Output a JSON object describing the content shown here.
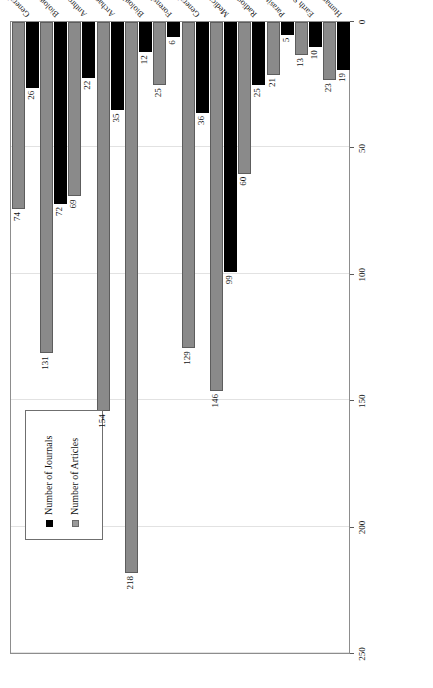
{
  "chart_data": {
    "type": "bar",
    "orientation": "horizontal",
    "title": "",
    "subtitle": "",
    "xlabel": "",
    "ylabel": "",
    "xlim": [
      0,
      250
    ],
    "xticks": [
      "0",
      "50",
      "100",
      "150",
      "200",
      "250"
    ],
    "grid": true,
    "legend_position": "upper-left",
    "categories": [
      "General Science",
      "Biology/Chemistry",
      "Anthropology",
      "Archaeology",
      "Biological Anthropology",
      "Forensic",
      "General Medical",
      "Medical Specialties",
      "Radiography/Imaging",
      "Parasitology",
      "Earth Science",
      "Humanities"
    ],
    "series": [
      {
        "name": "Number of Journals",
        "color": "#000000",
        "values": [
          26,
          72,
          22,
          35,
          12,
          6,
          36,
          99,
          25,
          5,
          10,
          19
        ]
      },
      {
        "name": "Number of Articles",
        "color": "#8a8a8a",
        "values": [
          74,
          131,
          69,
          154,
          218,
          25,
          129,
          146,
          60,
          21,
          13,
          23
        ]
      }
    ]
  },
  "legend": {
    "items": [
      {
        "label": "Number of Journals",
        "swatch": "journals"
      },
      {
        "label": "Number of Articles",
        "swatch": "articles"
      }
    ]
  }
}
